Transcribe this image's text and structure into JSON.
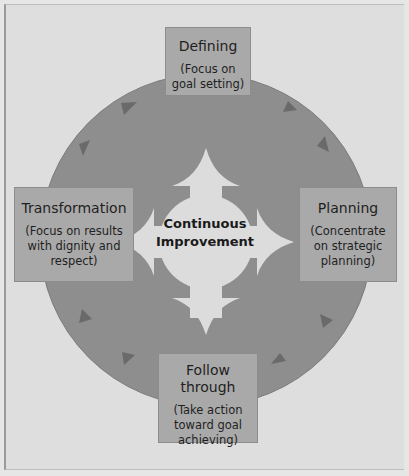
{
  "diagram": {
    "center": {
      "line1": "Continuous",
      "line2": "Improvement"
    },
    "stages": {
      "top": {
        "title": "Defining",
        "desc_lines": [
          "(Focus on",
          "goal setting)"
        ]
      },
      "right": {
        "title": "Planning",
        "desc_lines": [
          "(Concentrate",
          "on strategic",
          "planning)"
        ]
      },
      "bottom": {
        "title": "Follow through",
        "desc_lines": [
          "(Take action",
          "toward goal",
          "achieving)"
        ]
      },
      "left": {
        "title": "Transformation",
        "desc_lines": [
          "(Focus on results",
          "with dignity and",
          "respect)"
        ]
      }
    },
    "flow_direction": "clockwise",
    "colors": {
      "background": "#dedede",
      "circle": "#8e8e8e",
      "boxes": "#a9a9a9",
      "center_arrow": "#dcdcdc",
      "cycle_arrowheads": "#6a6a6a",
      "text": "#1f1f1f"
    }
  }
}
